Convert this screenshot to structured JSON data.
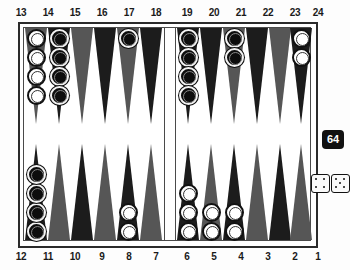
{
  "board": {
    "title": "backgammon-board",
    "colors": {
      "dark_point": "#1c1c1c",
      "light_point": "#565656",
      "frame": "#2b2b2b",
      "white_checker": "#ffffff",
      "black_checker": "#0d0d0d",
      "cube": "#111111"
    },
    "top_labels": [
      "13",
      "14",
      "15",
      "16",
      "17",
      "18",
      "19",
      "20",
      "21",
      "22",
      "23",
      "24"
    ],
    "bottom_labels": [
      "12",
      "11",
      "10",
      "9",
      "8",
      "7",
      "6",
      "5",
      "4",
      "3",
      "2",
      "1"
    ],
    "points": [
      {
        "number": "13",
        "row": "top",
        "quadrant": "left",
        "shade": "light",
        "checkers": 4,
        "color": "white"
      },
      {
        "number": "14",
        "row": "top",
        "quadrant": "left",
        "shade": "dark",
        "checkers": 4,
        "color": "black"
      },
      {
        "number": "15",
        "row": "top",
        "quadrant": "left",
        "shade": "light",
        "checkers": 0,
        "color": ""
      },
      {
        "number": "16",
        "row": "top",
        "quadrant": "left",
        "shade": "dark",
        "checkers": 0,
        "color": ""
      },
      {
        "number": "17",
        "row": "top",
        "quadrant": "left",
        "shade": "light",
        "checkers": 1,
        "color": "black"
      },
      {
        "number": "18",
        "row": "top",
        "quadrant": "left",
        "shade": "dark",
        "checkers": 0,
        "color": ""
      },
      {
        "number": "19",
        "row": "top",
        "quadrant": "right",
        "shade": "dark",
        "checkers": 4,
        "color": "black"
      },
      {
        "number": "20",
        "row": "top",
        "quadrant": "right",
        "shade": "dark",
        "checkers": 0,
        "color": ""
      },
      {
        "number": "21",
        "row": "top",
        "quadrant": "right",
        "shade": "light",
        "checkers": 2,
        "color": "black"
      },
      {
        "number": "22",
        "row": "top",
        "quadrant": "right",
        "shade": "dark",
        "checkers": 0,
        "color": ""
      },
      {
        "number": "23",
        "row": "top",
        "quadrant": "right",
        "shade": "light",
        "checkers": 0,
        "color": ""
      },
      {
        "number": "24",
        "row": "top",
        "quadrant": "right",
        "shade": "dark",
        "checkers": 2,
        "color": "white"
      },
      {
        "number": "12",
        "row": "bottom",
        "quadrant": "left",
        "shade": "dark",
        "checkers": 4,
        "color": "black"
      },
      {
        "number": "11",
        "row": "bottom",
        "quadrant": "left",
        "shade": "light",
        "checkers": 0,
        "color": ""
      },
      {
        "number": "10",
        "row": "bottom",
        "quadrant": "left",
        "shade": "dark",
        "checkers": 0,
        "color": ""
      },
      {
        "number": "9",
        "row": "bottom",
        "quadrant": "left",
        "shade": "light",
        "checkers": 0,
        "color": ""
      },
      {
        "number": "8",
        "row": "bottom",
        "quadrant": "left",
        "shade": "dark",
        "checkers": 2,
        "color": "white"
      },
      {
        "number": "7",
        "row": "bottom",
        "quadrant": "left",
        "shade": "light",
        "checkers": 0,
        "color": ""
      },
      {
        "number": "6",
        "row": "bottom",
        "quadrant": "right",
        "shade": "dark",
        "checkers": 3,
        "color": "white"
      },
      {
        "number": "5",
        "row": "bottom",
        "quadrant": "right",
        "shade": "light",
        "checkers": 2,
        "color": "white"
      },
      {
        "number": "4",
        "row": "bottom",
        "quadrant": "right",
        "shade": "dark",
        "checkers": 2,
        "color": "white"
      },
      {
        "number": "3",
        "row": "bottom",
        "quadrant": "right",
        "shade": "light",
        "checkers": 0,
        "color": ""
      },
      {
        "number": "2",
        "row": "bottom",
        "quadrant": "right",
        "shade": "dark",
        "checkers": 0,
        "color": ""
      },
      {
        "number": "1",
        "row": "bottom",
        "quadrant": "right",
        "shade": "light",
        "checkers": 0,
        "color": ""
      }
    ]
  },
  "doubling_cube": {
    "value": "64"
  },
  "dice": {
    "die1": 4,
    "die2": 5,
    "roll_label": "4-5"
  }
}
